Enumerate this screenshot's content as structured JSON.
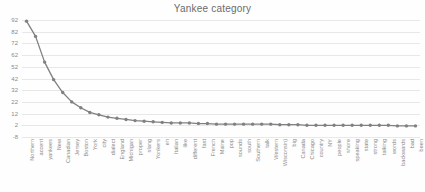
{
  "chart_data": {
    "type": "line",
    "title": "Yankee category",
    "xlabel": "",
    "ylabel": "",
    "ylim": [
      -8,
      92
    ],
    "yticks": [
      92,
      82,
      72,
      62,
      52,
      42,
      32,
      22,
      12,
      2,
      -8
    ],
    "grid": true,
    "legend": "none",
    "marker": "circle",
    "line_color": "#808080",
    "marker_color": "#808080",
    "grid_color": "#e8e8e8",
    "axis_text_color": "#8a8a8a",
    "title_color": "#6b6b6b",
    "categories": [
      "Northern",
      "accent",
      "yankees",
      "New",
      "Canadian",
      "Jersey",
      "Boston",
      "York",
      "city",
      "dialect",
      "England",
      "Michigan",
      "proper",
      "slang",
      "Yonkers",
      "eh",
      "Italian",
      "like",
      "different",
      "fast",
      "French",
      "Maine",
      "pop",
      "sounds",
      "south",
      "Southern",
      "talk",
      "Western",
      "Wisconsin)",
      "big",
      "Canada",
      "Chicago",
      "country",
      "NY",
      "people",
      "shore",
      "speaking",
      "state",
      "strong",
      "talking",
      "words",
      "backwards",
      "bad",
      "been"
    ],
    "values": [
      91,
      78,
      56,
      41,
      30,
      22,
      17,
      13,
      11,
      9,
      8,
      7,
      6,
      5.5,
      5,
      4.5,
      4,
      4,
      4,
      3.5,
      3.5,
      3,
      3,
      3,
      3,
      3,
      3,
      3,
      2.5,
      2.5,
      2.5,
      2,
      2,
      2,
      2,
      2,
      2,
      2,
      2,
      2,
      2,
      1.5,
      1.5,
      1.5
    ]
  }
}
